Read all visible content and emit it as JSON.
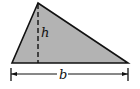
{
  "diagram": {
    "type": "triangle-area",
    "labels": {
      "height": "h",
      "base": "b"
    },
    "colors": {
      "fill": "#b3b3b3",
      "stroke": "#111111",
      "background": "#ffffff"
    },
    "geometry": {
      "apex": [
        38,
        3
      ],
      "base_left": [
        12,
        63
      ],
      "base_right": [
        128,
        63
      ],
      "height_foot": [
        38,
        63
      ],
      "dimension_line_y": 74,
      "dimension_x_range": [
        11,
        128
      ]
    }
  }
}
